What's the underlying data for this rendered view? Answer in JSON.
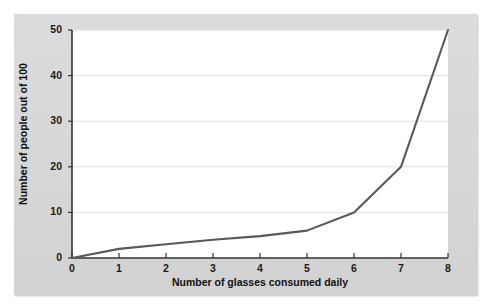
{
  "chart_data": {
    "type": "line",
    "title": "",
    "xlabel": "Number of glasses consumed daily",
    "ylabel": "Number of people out of 100",
    "xlim": [
      0,
      8
    ],
    "ylim": [
      0,
      50
    ],
    "xticks": [
      "0",
      "1",
      "2",
      "3",
      "4",
      "5",
      "6",
      "7",
      "8"
    ],
    "yticks": [
      "0",
      "10",
      "20",
      "30",
      "40",
      "50"
    ],
    "grid": "horizontal",
    "legend": "none",
    "x": [
      0,
      1,
      2,
      3,
      4,
      5,
      6,
      7,
      8
    ],
    "values": [
      0,
      2,
      3,
      4,
      4.8,
      6,
      10,
      20,
      50
    ],
    "series": [
      {
        "name": "Number of people out of 100",
        "values": [
          0,
          2,
          3,
          4,
          4.8,
          6,
          10,
          20,
          50
        ]
      }
    ],
    "line_color": "#595959",
    "grid_color": "#e0e0e0",
    "axis_color": "#333333",
    "plot_background": "#ffffff",
    "panel_background": "#d9d9d9"
  }
}
